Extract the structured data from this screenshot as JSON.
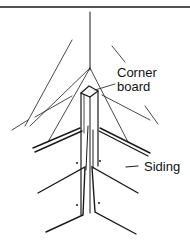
{
  "diagram": {
    "labels": {
      "corner_board_line1": "Corner",
      "corner_board_line2": "board",
      "siding": "Siding"
    },
    "colors": {
      "line": "#1a1a1a",
      "background": "#ffffff"
    }
  }
}
